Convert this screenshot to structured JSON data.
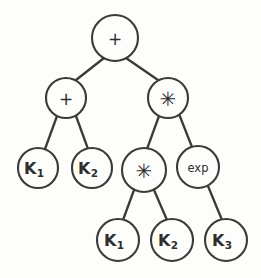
{
  "figure": {
    "kind": "binary-expression-tree",
    "stroke_color": "#3b3a38",
    "background_color": "#fdfdfc",
    "width": 261,
    "height": 278
  },
  "nodes": [
    {
      "id": "n0",
      "label": "+",
      "kind": "operator",
      "symbol": "plus",
      "level": 0,
      "cx": 115,
      "cy": 38,
      "r": 23
    },
    {
      "id": "n1",
      "label": "+",
      "kind": "operator",
      "symbol": "plus",
      "level": 1,
      "cx": 66,
      "cy": 98,
      "r": 20
    },
    {
      "id": "n2",
      "label": "✳",
      "kind": "operator",
      "symbol": "asterisk",
      "level": 1,
      "cx": 168,
      "cy": 98,
      "r": 20
    },
    {
      "id": "n3",
      "label": "K",
      "sub": "1",
      "kind": "variable",
      "symbol": "k-one",
      "level": 2,
      "cx": 38,
      "cy": 168,
      "r": 20
    },
    {
      "id": "n4",
      "label": "K",
      "sub": "2",
      "kind": "variable",
      "symbol": "k-two",
      "level": 2,
      "cx": 92,
      "cy": 168,
      "r": 20
    },
    {
      "id": "n5",
      "label": "✳",
      "kind": "operator",
      "symbol": "asterisk",
      "level": 2,
      "cx": 144,
      "cy": 170,
      "r": 22
    },
    {
      "id": "n6",
      "label": "exp",
      "kind": "function",
      "symbol": "exp",
      "level": 2,
      "cx": 198,
      "cy": 167,
      "r": 21
    },
    {
      "id": "n7",
      "label": "K",
      "sub": "1",
      "kind": "variable",
      "symbol": "k-one",
      "level": 3,
      "cx": 118,
      "cy": 240,
      "r": 21
    },
    {
      "id": "n8",
      "label": "K",
      "sub": "2",
      "kind": "variable",
      "symbol": "k-two",
      "level": 3,
      "cx": 172,
      "cy": 240,
      "r": 21
    },
    {
      "id": "n9",
      "label": "K",
      "sub": "3",
      "kind": "variable",
      "symbol": "k-three",
      "level": 3,
      "cx": 226,
      "cy": 240,
      "r": 21
    }
  ],
  "edges": [
    {
      "from": "n0",
      "to": "n1",
      "x1": 104,
      "y1": 58,
      "x2": 76,
      "y2": 80
    },
    {
      "from": "n0",
      "to": "n2",
      "x1": 126,
      "y1": 58,
      "x2": 158,
      "y2": 80
    },
    {
      "from": "n1",
      "to": "n3",
      "x1": 57,
      "y1": 116,
      "x2": 45,
      "y2": 149
    },
    {
      "from": "n1",
      "to": "n4",
      "x1": 76,
      "y1": 116,
      "x2": 88,
      "y2": 149
    },
    {
      "from": "n2",
      "to": "n5",
      "x1": 159,
      "y1": 116,
      "x2": 147,
      "y2": 149
    },
    {
      "from": "n2",
      "to": "n6",
      "x1": 179,
      "y1": 114,
      "x2": 192,
      "y2": 147
    },
    {
      "from": "n5",
      "to": "n7",
      "x1": 134,
      "y1": 190,
      "x2": 123,
      "y2": 220
    },
    {
      "from": "n5",
      "to": "n8",
      "x1": 154,
      "y1": 190,
      "x2": 167,
      "y2": 220
    },
    {
      "from": "n6",
      "to": "n9",
      "x1": 208,
      "y1": 186,
      "x2": 222,
      "y2": 220
    }
  ],
  "expression": "(K1 + K2) * (K1 * K2) * exp(K3)"
}
